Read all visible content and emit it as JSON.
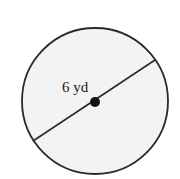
{
  "diagram": {
    "shape": "circle",
    "segment": "diameter",
    "label": "6 yd",
    "measurement": {
      "value": 6,
      "unit": "yd",
      "refers_to": "diameter"
    },
    "colors": {
      "fill": "#f3f3f3",
      "stroke": "#2a2a2a",
      "center_dot": "#111111",
      "label": "#1a1a1a"
    }
  }
}
